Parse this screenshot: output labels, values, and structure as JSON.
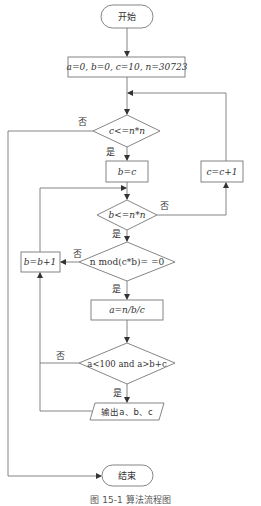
{
  "flowchart": {
    "start": {
      "label": "开始"
    },
    "init": {
      "label": "a=0, b=0, c=10, n=30723"
    },
    "cond_c": {
      "label": "c<=n*n"
    },
    "assign_b": {
      "label": "b=c"
    },
    "cond_b": {
      "label": "b<=n*n"
    },
    "cond_mod": {
      "label": "n mod(c*b)= =0"
    },
    "inc_b": {
      "label": "b=b+1"
    },
    "calc_a": {
      "label": "a=n/b/c"
    },
    "cond_a": {
      "label": "a<100 and a>b+c"
    },
    "output": {
      "label": "输出a、b、c"
    },
    "inc_c": {
      "label": "c=c+1"
    },
    "end": {
      "label": "结束"
    },
    "edge_labels": {
      "yes": "是",
      "no": "否"
    }
  },
  "caption": "图 15-1  算法流程图",
  "colors": {
    "line": "#777777",
    "text": "#333333",
    "background": "#ffffff"
  }
}
